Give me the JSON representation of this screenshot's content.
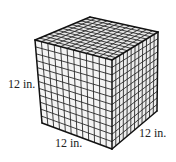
{
  "figure": {
    "type": "cube",
    "grid_divisions": 12,
    "colors": {
      "background": "#ffffff",
      "face_top": "#e6e6e6",
      "face_front": "#f4f4f4",
      "face_right": "#ececec",
      "grid_line": "#2a2a2a",
      "edge_line": "#111111",
      "label_text": "#222222"
    },
    "vertices": {
      "top_back": [
        90,
        17
      ],
      "top_left": [
        35,
        40
      ],
      "top_right": [
        158,
        32
      ],
      "top_front": [
        112,
        60
      ],
      "bottom_left": [
        42,
        123
      ],
      "bottom_right": [
        157,
        111
      ],
      "bottom_front": [
        112,
        149
      ]
    }
  },
  "labels": {
    "height": "12 in.",
    "width": "12 in.",
    "depth": "12 in."
  }
}
